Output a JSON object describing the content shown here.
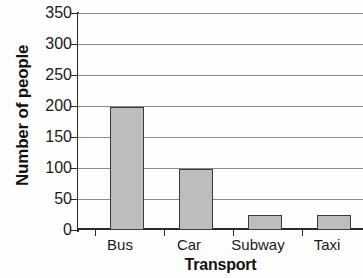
{
  "chart_data": {
    "type": "bar",
    "title": "",
    "categories": [
      "Bus",
      "Car",
      "Subway",
      "Taxi"
    ],
    "values": [
      200,
      100,
      25,
      25
    ],
    "series": [
      {
        "name": "Number of people",
        "values": [
          200,
          100,
          25,
          25
        ]
      }
    ],
    "xlabel": "Transport",
    "ylabel": "Number of people",
    "ylim": [
      0,
      350
    ],
    "yticks": [
      0,
      50,
      100,
      150,
      200,
      250,
      300,
      350
    ],
    "ytick_labels": [
      "0",
      "50",
      "100",
      "150",
      "200",
      "250",
      "300",
      "350"
    ],
    "grid": true,
    "grid_axis": "y",
    "legend": false,
    "legend_position": "none",
    "bar_color": "#bdbdbd",
    "bar_edge_color": "#3a3a3a",
    "gridline_color": "#8a8a8a",
    "axis_color": "#2b2b2b",
    "background_color": "#fefefe",
    "cropped_right": true,
    "cropped_title": true
  },
  "axes": {
    "y_title": "Number of people",
    "x_title": "Transport",
    "y_tick_0": "0",
    "y_tick_50": "50",
    "y_tick_100": "100",
    "y_tick_150": "150",
    "y_tick_200": "200",
    "y_tick_250": "250",
    "y_tick_300": "300",
    "y_tick_350": "350"
  },
  "categories": {
    "cat_0": "Bus",
    "cat_1": "Car",
    "cat_2": "Subway",
    "cat_3": "Taxi"
  },
  "title": {
    "text": ""
  }
}
